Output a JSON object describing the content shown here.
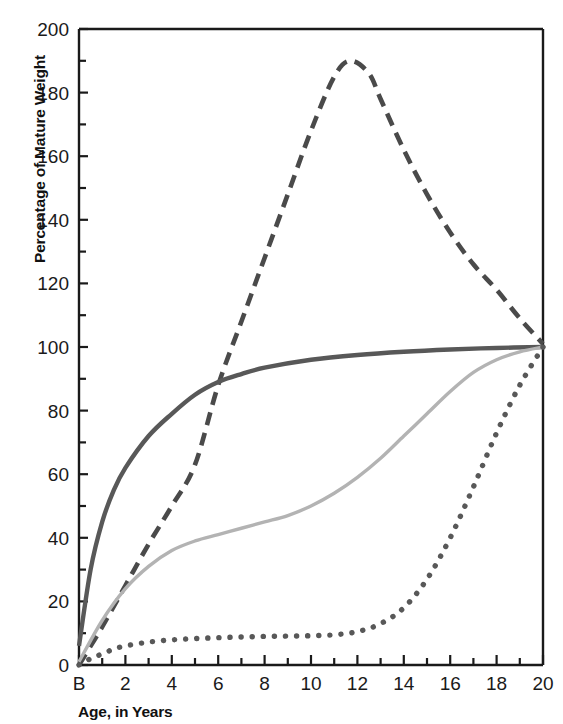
{
  "chart_data": {
    "type": "line",
    "title": "",
    "xlabel": "Age, in Years",
    "ylabel": "Percentage of Mature Weight",
    "xlim": [
      0,
      20
    ],
    "ylim": [
      0,
      200
    ],
    "grid": false,
    "legend": "none",
    "x_tick_labels": [
      "B",
      "2",
      "4",
      "6",
      "8",
      "10",
      "12",
      "14",
      "16",
      "18",
      "20"
    ],
    "x_tick_values": [
      0,
      2,
      4,
      6,
      8,
      10,
      12,
      14,
      16,
      18,
      20
    ],
    "x_minor_tick_values": [
      1,
      3,
      5,
      7,
      9,
      11,
      13,
      15,
      17,
      19
    ],
    "y_tick_labels": [
      "0",
      "20",
      "40",
      "60",
      "80",
      "100",
      "120",
      "140",
      "160",
      "180",
      "200"
    ],
    "y_tick_values": [
      0,
      20,
      40,
      60,
      80,
      100,
      120,
      140,
      160,
      180,
      200
    ],
    "y_minor_tick_values": [
      10,
      30,
      50,
      70,
      90,
      110,
      130,
      150,
      170,
      190
    ],
    "series": [
      {
        "name": "lymphoid",
        "style": "dashed",
        "color": "#4a4a4a",
        "x": [
          0,
          1,
          2,
          3,
          4,
          5,
          6,
          7,
          8,
          9,
          10,
          11,
          11.7,
          12.5,
          13,
          14,
          15,
          16,
          17,
          18,
          19,
          20
        ],
        "values": [
          0,
          12,
          25,
          38,
          50,
          63,
          88,
          108,
          128,
          148,
          168,
          185,
          190,
          186,
          178,
          162,
          148,
          136,
          126,
          118,
          109,
          101
        ]
      },
      {
        "name": "neural",
        "style": "solid",
        "color": "#585858",
        "x": [
          0,
          0.5,
          1,
          1.5,
          2,
          3,
          4,
          5,
          6,
          7,
          8,
          10,
          12,
          14,
          16,
          18,
          20
        ],
        "values": [
          6,
          30,
          45,
          55,
          62,
          72,
          79,
          85,
          89,
          91.5,
          93.5,
          96,
          97.5,
          98.5,
          99.2,
          99.7,
          100
        ]
      },
      {
        "name": "general",
        "style": "solid",
        "color": "#b3b3b3",
        "x": [
          0,
          1,
          2,
          3,
          4,
          5,
          6,
          7,
          8,
          9,
          10,
          11,
          12,
          13,
          14,
          15,
          16,
          17,
          18,
          19,
          20
        ],
        "values": [
          1,
          14,
          24,
          31,
          36,
          39,
          41,
          43,
          45,
          47,
          50,
          54,
          59,
          65,
          72,
          79,
          86,
          92,
          96,
          98.5,
          100
        ]
      },
      {
        "name": "genital",
        "style": "dotted",
        "color": "#585858",
        "x": [
          0,
          0.5,
          1,
          1.5,
          2,
          3,
          4,
          5,
          6,
          7,
          8,
          9,
          10,
          11,
          12,
          13,
          14,
          15,
          16,
          17,
          18,
          19,
          20
        ],
        "values": [
          0,
          2,
          3.5,
          5,
          6,
          7.2,
          7.9,
          8.3,
          8.6,
          8.8,
          9,
          9.1,
          9.2,
          9.5,
          10.5,
          13,
          18,
          27,
          40,
          56,
          73,
          88,
          100
        ]
      }
    ]
  }
}
